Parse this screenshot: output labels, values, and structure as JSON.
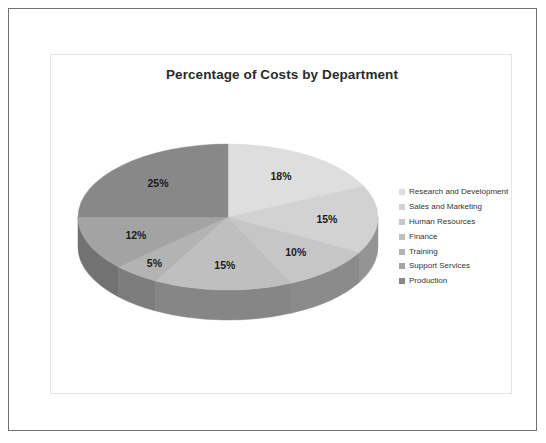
{
  "document": {
    "background_color": "#ffffff",
    "outer_border_color": "#6f7072",
    "inner_frame_color": "#e3e5e8"
  },
  "chart_data": {
    "type": "pie",
    "title": "Percentage of Costs by Department",
    "xlabel": "",
    "ylabel": "",
    "three_d": true,
    "start_angle_deg": 0,
    "direction": "clockwise",
    "legend_position": "right",
    "grid": false,
    "categories": [
      "Research and Development",
      "Sales and Marketing",
      "Human Resources",
      "Finance",
      "Training",
      "Support Services",
      "Production"
    ],
    "values": [
      18,
      15,
      10,
      15,
      5,
      12,
      25
    ],
    "data_labels": [
      "18%",
      "15%",
      "10%",
      "15%",
      "5%",
      "12%",
      "25%"
    ],
    "colors": [
      "#dedede",
      "#d2d2d2",
      "#c6c6c6",
      "#bfbfbf",
      "#b3b3b3",
      "#a3a3a3",
      "#888888"
    ],
    "side_colors": [
      "#9e9e9e",
      "#949494",
      "#8b8b8b",
      "#868686",
      "#7d7d7d",
      "#727272",
      "#5f5f5f"
    ]
  },
  "legend": {
    "items": [
      {
        "label": "Research and Development",
        "color": "#dedede"
      },
      {
        "label": "Sales and Marketing",
        "color": "#d2d2d2"
      },
      {
        "label": "Human Resources",
        "color": "#c6c6c6"
      },
      {
        "label": "Finance",
        "color": "#bfbfbf"
      },
      {
        "label": "Training",
        "color": "#b3b3b3"
      },
      {
        "label": "Support Services",
        "color": "#a3a3a3"
      },
      {
        "label": "Production",
        "color": "#888888"
      }
    ]
  }
}
